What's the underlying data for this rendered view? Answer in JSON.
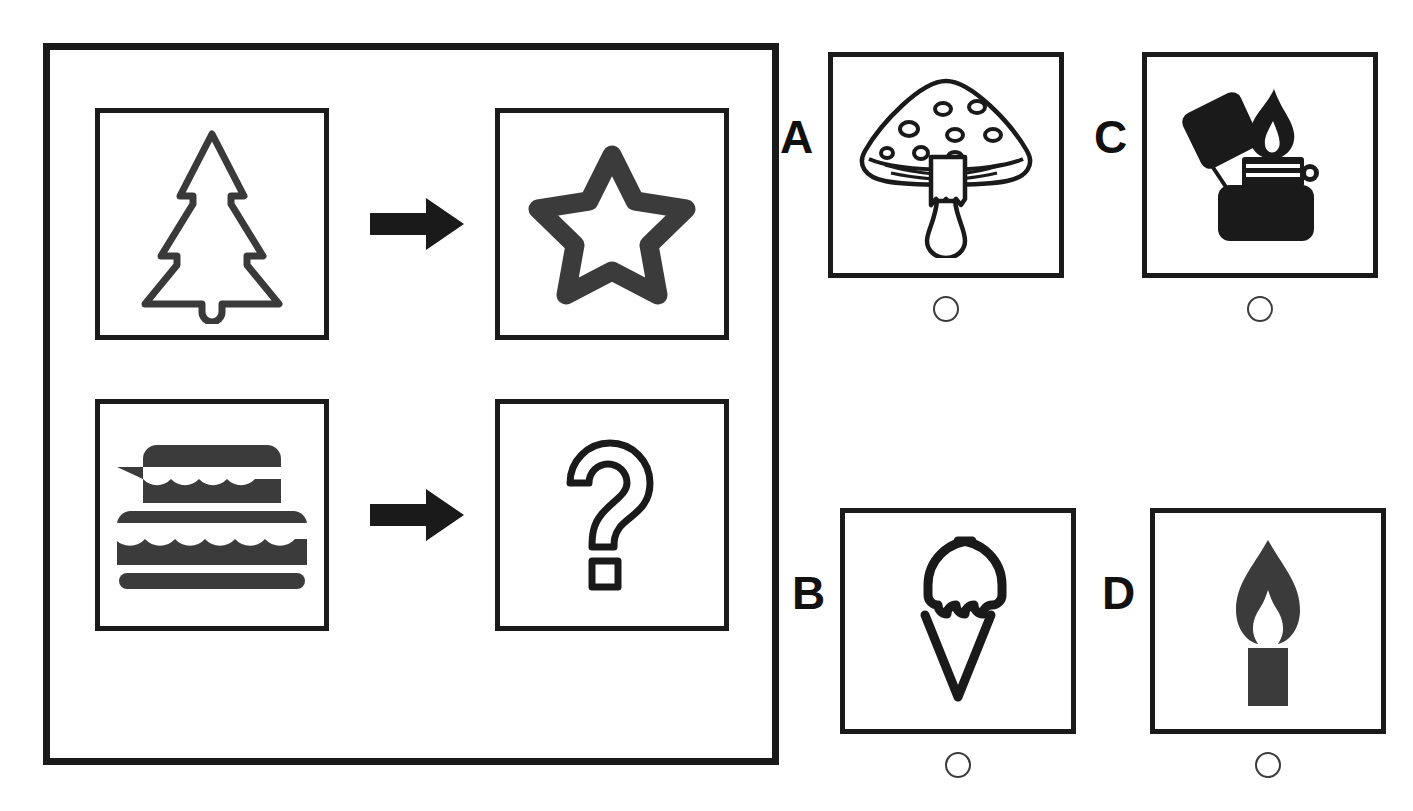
{
  "task": {
    "type": "visual-analogy-multiple-choice",
    "panel_label": "analogy-panel",
    "rows": [
      {
        "source_icon": "christmas-tree-icon",
        "relation_icon": "right-arrow-icon",
        "target_icon": "star-icon"
      },
      {
        "source_icon": "birthday-cake-icon",
        "relation_icon": "right-arrow-icon",
        "target_icon": "question-mark-icon"
      }
    ]
  },
  "options": [
    {
      "letter": "A",
      "icon": "mushroom-icon",
      "selected": false
    },
    {
      "letter": "B",
      "icon": "ice-cream-cone-icon",
      "selected": false
    },
    {
      "letter": "C",
      "icon": "lighter-icon",
      "selected": false
    },
    {
      "letter": "D",
      "icon": "candle-icon",
      "selected": false
    }
  ],
  "colors": {
    "ink": "#1a1a1a",
    "fill": "#3b3b3b",
    "outline": "#3a3a3a",
    "background": "#ffffff",
    "radio_border": "#3c3c3c"
  }
}
